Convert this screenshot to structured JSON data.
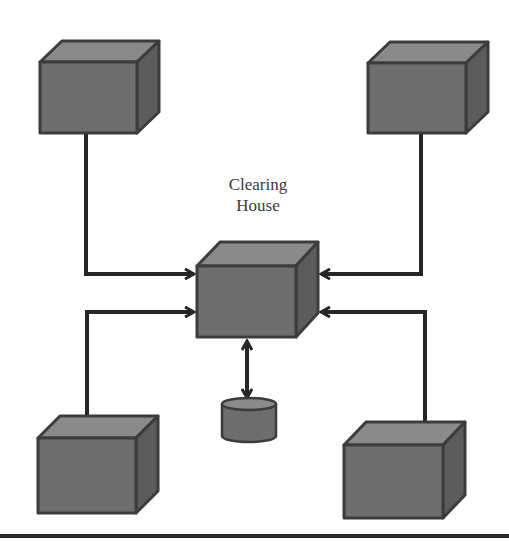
{
  "diagram": {
    "center_node": {
      "label_line1": "Clearing",
      "label_line2": "House"
    },
    "nodes": [
      {
        "id": "top-left",
        "shape": "cube"
      },
      {
        "id": "top-right",
        "shape": "cube"
      },
      {
        "id": "bottom-left",
        "shape": "cube"
      },
      {
        "id": "bottom-right",
        "shape": "cube"
      },
      {
        "id": "clearing-house",
        "shape": "cube"
      },
      {
        "id": "database",
        "shape": "cylinder"
      }
    ],
    "edges": [
      {
        "from": "top-left",
        "to": "clearing-house",
        "arrow": "single"
      },
      {
        "from": "bottom-left",
        "to": "clearing-house",
        "arrow": "single"
      },
      {
        "from": "top-right",
        "to": "clearing-house",
        "arrow": "single"
      },
      {
        "from": "bottom-right",
        "to": "clearing-house",
        "arrow": "single"
      },
      {
        "from": "clearing-house",
        "to": "database",
        "arrow": "double"
      }
    ],
    "colors": {
      "cube_front": "#6e6e6e",
      "cube_top": "#8a8a8a",
      "cube_side": "#5c5c5c",
      "outline": "#3c3c3c",
      "line": "#262626",
      "rule": "#2a2a2a"
    }
  }
}
